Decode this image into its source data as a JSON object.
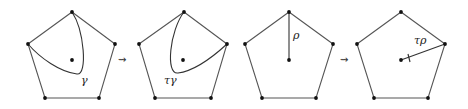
{
  "figure": {
    "panels": [
      {
        "id": "p1",
        "label": "γ",
        "kind": "curve"
      },
      {
        "id": "p2",
        "label": "τγ",
        "kind": "curve-twisted"
      },
      {
        "id": "p3",
        "label": "ρ",
        "kind": "radius"
      },
      {
        "id": "p4",
        "label": "τρ",
        "kind": "radius-twisted"
      }
    ],
    "arrows": [
      "⇝",
      "⇝"
    ]
  }
}
